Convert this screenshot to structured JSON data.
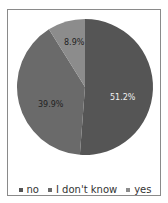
{
  "chart_data": {
    "type": "pie",
    "title": "",
    "categories": [
      "no",
      "I don't know",
      "yes"
    ],
    "values": [
      51.2,
      39.9,
      8.9
    ],
    "labels": [
      "51.2%",
      "39.9%",
      "8.9%"
    ],
    "colors": [
      "#555555",
      "#6a6a6a",
      "#8c8c8c"
    ],
    "legend_position": "bottom"
  },
  "legend": {
    "items": [
      {
        "label": "no",
        "color": "#555555"
      },
      {
        "label": "I don't know",
        "color": "#6a6a6a"
      },
      {
        "label": "yes",
        "color": "#8c8c8c"
      }
    ]
  },
  "slice_labels": {
    "no": "51.2%",
    "idk": "39.9%",
    "yes": "8.9%"
  }
}
